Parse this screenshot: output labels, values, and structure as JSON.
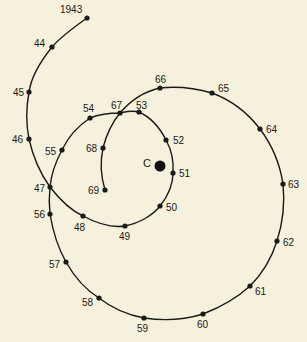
{
  "diagram": {
    "type": "spiral-path",
    "center": {
      "label": "C",
      "x": 160,
      "y": 166
    },
    "line_color": "#1a1a1a",
    "background": "#f6f1dc",
    "points": [
      {
        "label": "1943",
        "x": 87,
        "y": 18,
        "lx": 60,
        "ly": 13
      },
      {
        "label": "44",
        "x": 52,
        "y": 47,
        "lx": 34,
        "ly": 47
      },
      {
        "label": "45",
        "x": 29,
        "y": 92,
        "lx": 13,
        "ly": 96
      },
      {
        "label": "46",
        "x": 29,
        "y": 139,
        "lx": 12,
        "ly": 143
      },
      {
        "label": "47",
        "x": 50,
        "y": 187,
        "lx": 34,
        "ly": 192
      },
      {
        "label": "48",
        "x": 83,
        "y": 216,
        "lx": 74,
        "ly": 231
      },
      {
        "label": "49",
        "x": 125,
        "y": 226,
        "lx": 119,
        "ly": 240
      },
      {
        "label": "50",
        "x": 160,
        "y": 206,
        "lx": 166,
        "ly": 211
      },
      {
        "label": "51",
        "x": 173,
        "y": 173,
        "lx": 179,
        "ly": 177
      },
      {
        "label": "52",
        "x": 166,
        "y": 140,
        "lx": 173,
        "ly": 144
      },
      {
        "label": "53",
        "x": 139,
        "y": 112,
        "lx": 136,
        "ly": 109
      },
      {
        "label": "54",
        "x": 90,
        "y": 118,
        "lx": 83,
        "ly": 112
      },
      {
        "label": "55",
        "x": 62,
        "y": 150,
        "lx": 45,
        "ly": 155
      },
      {
        "label": "56",
        "x": 50,
        "y": 214,
        "lx": 34,
        "ly": 218
      },
      {
        "label": "57",
        "x": 66,
        "y": 262,
        "lx": 49,
        "ly": 268
      },
      {
        "label": "58",
        "x": 99,
        "y": 298,
        "lx": 82,
        "ly": 306
      },
      {
        "label": "59",
        "x": 144,
        "y": 318,
        "lx": 137,
        "ly": 332
      },
      {
        "label": "60",
        "x": 203,
        "y": 314,
        "lx": 197,
        "ly": 328
      },
      {
        "label": "61",
        "x": 250,
        "y": 286,
        "lx": 255,
        "ly": 295
      },
      {
        "label": "62",
        "x": 277,
        "y": 241,
        "lx": 283,
        "ly": 246
      },
      {
        "label": "63",
        "x": 283,
        "y": 184,
        "lx": 288,
        "ly": 188
      },
      {
        "label": "64",
        "x": 260,
        "y": 129,
        "lx": 266,
        "ly": 133
      },
      {
        "label": "65",
        "x": 212,
        "y": 93,
        "lx": 218,
        "ly": 92
      },
      {
        "label": "66",
        "x": 160,
        "y": 88,
        "lx": 155,
        "ly": 83
      },
      {
        "label": "67",
        "x": 120,
        "y": 113,
        "lx": 111,
        "ly": 109
      },
      {
        "label": "68",
        "x": 103,
        "y": 148,
        "lx": 86,
        "ly": 152
      },
      {
        "label": "69",
        "x": 105,
        "y": 190,
        "lx": 88,
        "ly": 194
      }
    ],
    "path_order": [
      "1943",
      "44",
      "45",
      "46",
      "47",
      "48",
      "49",
      "50",
      "51",
      "52",
      "53",
      "67_cross",
      "54",
      "55",
      "47_cross",
      "56",
      "57",
      "58",
      "59",
      "60",
      "61",
      "62",
      "63",
      "64",
      "65",
      "66",
      "67",
      "68",
      "69"
    ]
  }
}
